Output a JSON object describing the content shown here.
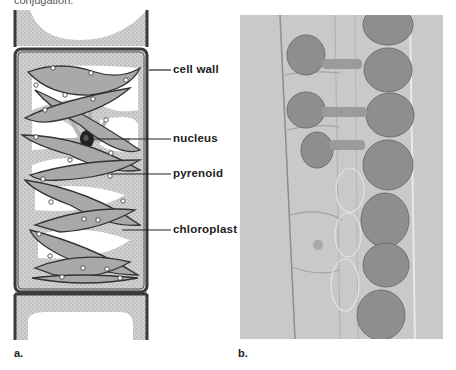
{
  "caption_fragment": "conjugation.",
  "figure": {
    "panel_a": {
      "letter": "a.",
      "description": "Line drawing of a Spirogyra filament cell showing spiral chloroplast",
      "labels": [
        {
          "id": "cell_wall",
          "text": "cell wall"
        },
        {
          "id": "nucleus",
          "text": "nucleus"
        },
        {
          "id": "pyrenoid",
          "text": "pyrenoid"
        },
        {
          "id": "chloroplast",
          "text": "chloroplast"
        }
      ]
    },
    "panel_b": {
      "letter": "b.",
      "description": "Light micrograph of Spirogyra filaments undergoing conjugation"
    }
  },
  "colors": {
    "cytoplasm_stipple": "#bdbdbd",
    "wall": "#3a3a3a",
    "chloroplast_fill": "#a9a9a9",
    "photo_bg": "#c9c9c7",
    "zygote": "#8e8e8c"
  }
}
